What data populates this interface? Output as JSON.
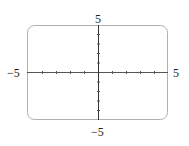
{
  "figure": {
    "type": "coordinate-axes",
    "box": {
      "left": 27,
      "top": 25,
      "right": 168,
      "bottom": 120,
      "radius": 7,
      "stroke": "#aaaaaa"
    },
    "axes": {
      "x_range": [
        -5,
        5
      ],
      "y_range": [
        -5,
        5
      ],
      "origin_px": [
        98,
        72
      ],
      "tick_spacing_x_px": 14,
      "tick_spacing_y_px": 9.5,
      "axis_color": "#444444"
    },
    "labels": {
      "y_max": "5",
      "y_min": "−5",
      "x_min": "−5",
      "x_max": "5"
    }
  }
}
